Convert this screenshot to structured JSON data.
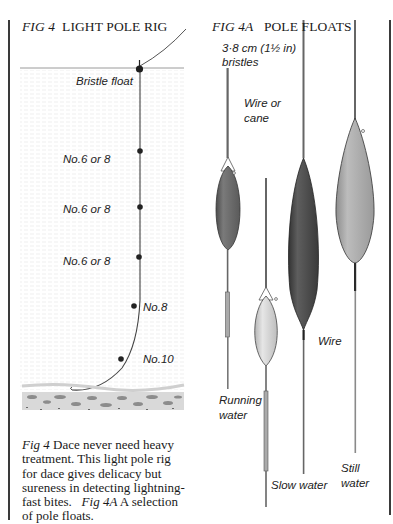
{
  "fig4": {
    "title_num": "FIG 4",
    "title_text": "LIGHT POLE RIG",
    "labels": {
      "float": "Bristle float",
      "shot1": "No.6 or 8",
      "shot2": "No.6 or 8",
      "shot3": "No.6 or 8",
      "shot4": "No.8",
      "shot5": "No.10"
    }
  },
  "fig4a": {
    "title_num": "FIG 4A",
    "title_text": "POLE FLOATS",
    "labels": {
      "bristles_line1": "3·8 cm (1½ in)",
      "bristles_line2": "bristles",
      "wire_cane_line1": "Wire or",
      "wire_cane_line2": "cane",
      "wire": "Wire",
      "running_line1": "Running",
      "running_line2": "water",
      "slow": "Slow water",
      "still_line1": "Still",
      "still_line2": "water"
    },
    "floats": [
      {
        "name": "running-water-float",
        "body_color": "#6a6a6a"
      },
      {
        "name": "slow-water-float",
        "body_color": "#c9c9c9"
      },
      {
        "name": "wire-float",
        "body_color": "#4a4a4a"
      },
      {
        "name": "still-water-float",
        "body_color": "#a3a3a3"
      }
    ]
  },
  "caption": {
    "fig4_ref": "Fig 4",
    "fig4_text": " Dace never need heavy treatment. This light pole rig for dace gives delicacy but sureness in detecting lightning-fast bites.",
    "fig4a_ref": "Fig 4A",
    "fig4a_text": " A selection of pole floats."
  }
}
